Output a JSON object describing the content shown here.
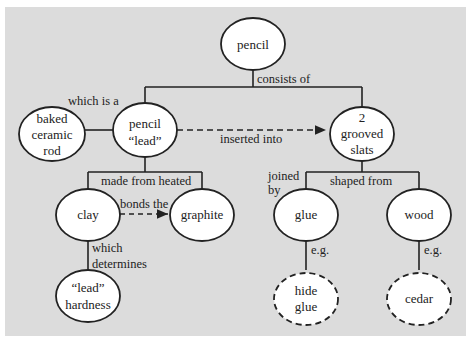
{
  "diagram": {
    "type": "concept-map",
    "background": "#dcdcdc",
    "nodes": [
      {
        "id": "pencil",
        "lines": [
          "pencil"
        ],
        "style": "solid"
      },
      {
        "id": "ceramic",
        "lines": [
          "baked",
          "ceramic",
          "rod"
        ],
        "style": "solid"
      },
      {
        "id": "lead",
        "lines": [
          "pencil",
          "“lead”"
        ],
        "style": "solid"
      },
      {
        "id": "slats",
        "lines": [
          "2",
          "grooved",
          "slats"
        ],
        "style": "solid"
      },
      {
        "id": "clay",
        "lines": [
          "clay"
        ],
        "style": "solid"
      },
      {
        "id": "graphite",
        "lines": [
          "graphite"
        ],
        "style": "solid"
      },
      {
        "id": "hardness",
        "lines": [
          "“lead”",
          "hardness"
        ],
        "style": "solid"
      },
      {
        "id": "glue",
        "lines": [
          "glue"
        ],
        "style": "solid"
      },
      {
        "id": "wood",
        "lines": [
          "wood"
        ],
        "style": "solid"
      },
      {
        "id": "hideglue",
        "lines": [
          "hide",
          "glue"
        ],
        "style": "dashed"
      },
      {
        "id": "cedar",
        "lines": [
          "cedar"
        ],
        "style": "dashed"
      }
    ],
    "edges": [
      {
        "from": "pencil",
        "to": [
          "lead",
          "slats"
        ],
        "label": "consists of",
        "style": "solid"
      },
      {
        "from": "lead",
        "to": "ceramic",
        "label": "which is a",
        "style": "solid"
      },
      {
        "from": "lead",
        "to": "slats",
        "label": "inserted into",
        "style": "dashed-arrow"
      },
      {
        "from": "lead",
        "to": [
          "clay",
          "graphite"
        ],
        "label": "made from heated",
        "style": "solid"
      },
      {
        "from": "clay",
        "to": "graphite",
        "label": "bonds the",
        "style": "dashed-arrow"
      },
      {
        "from": "clay",
        "to": "hardness",
        "label": "which determines",
        "style": "solid"
      },
      {
        "from": "slats",
        "to": [
          "glue",
          "wood"
        ],
        "label": "shaped from",
        "style": "solid"
      },
      {
        "from": "slats",
        "to": "glue",
        "label": "joined by",
        "style": "solid"
      },
      {
        "from": "glue",
        "to": "hideglue",
        "label": "e.g.",
        "style": "solid"
      },
      {
        "from": "wood",
        "to": "cedar",
        "label": "e.g.",
        "style": "solid"
      }
    ]
  },
  "labels": {
    "pencil": "pencil",
    "ceramic_1": "baked",
    "ceramic_2": "ceramic",
    "ceramic_3": "rod",
    "lead_1": "pencil",
    "lead_2": "“lead”",
    "slats_1": "2",
    "slats_2": "grooved",
    "slats_3": "slats",
    "clay": "clay",
    "graphite": "graphite",
    "hardness_1": "“lead”",
    "hardness_2": "hardness",
    "glue": "glue",
    "wood": "wood",
    "hideglue_1": "hide",
    "hideglue_2": "glue",
    "cedar": "cedar",
    "consists_of": "consists of",
    "which_is_a": "which is a",
    "inserted_into": "inserted into",
    "made_from_heated": "made from heated",
    "bonds_the": "bonds the",
    "which": "which",
    "determines": "determines",
    "shaped_from": "shaped from",
    "joined": "joined",
    "by": "by",
    "eg_glue": "e.g.",
    "eg_wood": "e.g."
  }
}
